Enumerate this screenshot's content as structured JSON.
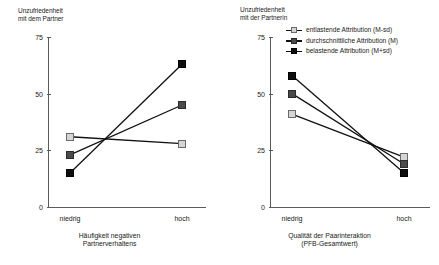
{
  "chart_data": [
    {
      "panel": "left",
      "type": "line",
      "title": "",
      "ylabel": "Unzufriedenheit\nmit dem Partner",
      "xlabel": "Häufigkeit negativen\nPartnerverhaltens",
      "categories": [
        "niedrig",
        "hoch"
      ],
      "yticks": [
        0,
        25,
        50,
        75
      ],
      "ylim": [
        0,
        75
      ],
      "grid": false,
      "legend": "none",
      "series": [
        {
          "name": "entlastende Attribution (M-sd)",
          "marker": "light",
          "values": [
            31,
            28
          ]
        },
        {
          "name": "durchschnittliche Attribution (M)",
          "marker": "mid",
          "values": [
            23,
            45
          ]
        },
        {
          "name": "belastende Attribution (M+sd)",
          "marker": "dark",
          "values": [
            15,
            63
          ]
        }
      ]
    },
    {
      "panel": "right",
      "type": "line",
      "title": "",
      "ylabel": "Unzufriedenheit\nmit der Partnerin",
      "xlabel": "Qualität der Paarinteraktion\n(PFB-Gesamtwert)",
      "categories": [
        "niedrig",
        "hoch"
      ],
      "yticks": [
        0,
        25,
        50,
        75
      ],
      "ylim": [
        0,
        75
      ],
      "grid": false,
      "legend": "top-right",
      "series": [
        {
          "name": "entlastende Attribution (M-sd)",
          "marker": "light",
          "values": [
            41,
            22
          ]
        },
        {
          "name": "durchschnittliche Attribution (M)",
          "marker": "mid",
          "values": [
            50,
            19
          ]
        },
        {
          "name": "belastende Attribution (M+sd)",
          "marker": "dark",
          "values": [
            58,
            15
          ]
        }
      ]
    }
  ],
  "legend": {
    "entries": [
      {
        "label": "entlastende Attribution (M-sd)",
        "marker": "light"
      },
      {
        "label": "durchschnittliche Attribution (M)",
        "marker": "mid"
      },
      {
        "label": "belastende Attribution (M+sd)",
        "marker": "dark"
      }
    ]
  },
  "colors": {
    "light_marker": "#d5d5d5",
    "mid_marker": "#4a4a4a",
    "dark_marker": "#0d0d0d",
    "line": "#111111",
    "axis": "#5a5a5a",
    "text": "#1a1a1a",
    "background": "#ffffff"
  }
}
